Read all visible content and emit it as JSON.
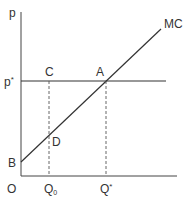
{
  "diagram": {
    "type": "economics-supply-diagram",
    "axes": {
      "y_label": "p",
      "x_origin_label": "O"
    },
    "curves": [
      {
        "name": "MC",
        "label": "MC",
        "kind": "line",
        "from_point": "B",
        "through": [
          "D",
          "A"
        ]
      }
    ],
    "price_level": {
      "label": "p",
      "label_sup": "*"
    },
    "points": [
      {
        "id": "A",
        "label": "A",
        "desc": "intersection of p* and MC"
      },
      {
        "id": "B",
        "label": "B",
        "desc": "MC intercept on price axis"
      },
      {
        "id": "C",
        "label": "C",
        "desc": "on p* line above Q0"
      },
      {
        "id": "D",
        "label": "D",
        "desc": "on MC curve at Q0"
      }
    ],
    "quantities": [
      {
        "label": "Q",
        "label_sub": "0"
      },
      {
        "label": "Q",
        "label_sup": "*"
      }
    ],
    "colors": {
      "line": "#333333",
      "dashed": "#555555",
      "background": "#ffffff"
    }
  }
}
